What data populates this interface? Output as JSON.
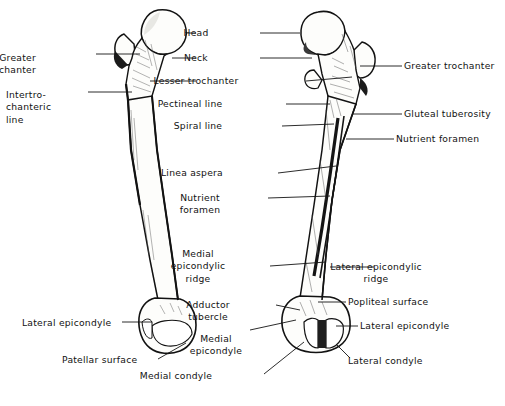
{
  "figure": {
    "background_color": "#ffffff",
    "ink_color": "#121212",
    "bone_fill_color": "#fdfdfb",
    "bone_shade_color": "#5a5a5a",
    "width": 505,
    "height": 406
  },
  "bones": [
    {
      "name": "left-femur-anterior-view",
      "view": "anterior",
      "side": "left"
    },
    {
      "name": "right-femur-posterior-view",
      "view": "posterior",
      "side": "right"
    }
  ],
  "labels": {
    "head": "Head",
    "neck": "Neck",
    "lesser_trochanter": "Lesser trochanter",
    "pectineal_line": "Pectineal line",
    "spiral_line": "Spiral line",
    "linea_aspera": "Linea aspera",
    "nutrient_foramen_center": "Nutrient\nforamen",
    "medial_epicondylic_ridge": "Medial\nepicondylic\nridge",
    "adductor_tubercle": "Adductor\ntubercle",
    "medial_epicondyle": "Medial\nepicondyle",
    "medial_condyle": "Medial condyle",
    "greater_trochanter_left": "Greater\ntrochanter",
    "intertrochanteric_line": "Intertro-\nchanteric\nline",
    "lateral_epicondyle_left": "Lateral epicondyle",
    "patellar_surface": "Patellar surface",
    "greater_trochanter_right": "Greater trochanter",
    "gluteal_tuberosity": "Gluteal tuberosity",
    "nutrient_foramen_right": "Nutrient foramen",
    "lateral_epicondylic_ridge": "Lateral epicondylic\nridge",
    "popliteal_surface": "Popliteal surface",
    "lateral_epicondyle_right": "Lateral epicondyle",
    "lateral_condyle": "Lateral condyle"
  },
  "label_positions": [
    {
      "key": "greater_trochanter_left",
      "x": 36,
      "y": 52,
      "align": "r",
      "w": 86
    },
    {
      "key": "intertrochanteric_line",
      "x": 6,
      "y": 89,
      "align": "l",
      "w": 90
    },
    {
      "key": "lateral_epicondyle_left",
      "x": 22,
      "y": 317,
      "align": "l",
      "w": 100
    },
    {
      "key": "patellar_surface",
      "x": 62,
      "y": 354,
      "align": "l",
      "w": 96
    },
    {
      "key": "head",
      "x": 196,
      "y": 27,
      "align": "c",
      "w": 64
    },
    {
      "key": "neck",
      "x": 196,
      "y": 52,
      "align": "c",
      "w": 64
    },
    {
      "key": "lesser_trochanter",
      "x": 196,
      "y": 75,
      "align": "c",
      "w": 110
    },
    {
      "key": "pectineal_line",
      "x": 190,
      "y": 98,
      "align": "c",
      "w": 96
    },
    {
      "key": "spiral_line",
      "x": 198,
      "y": 120,
      "align": "c",
      "w": 84
    },
    {
      "key": "linea_aspera",
      "x": 192,
      "y": 167,
      "align": "c",
      "w": 86
    },
    {
      "key": "nutrient_foramen_center",
      "x": 200,
      "y": 192,
      "align": "c",
      "w": 68
    },
    {
      "key": "medial_epicondylic_ridge",
      "x": 198,
      "y": 248,
      "align": "c",
      "w": 72
    },
    {
      "key": "adductor_tubercle",
      "x": 208,
      "y": 299,
      "align": "c",
      "w": 68
    },
    {
      "key": "medial_epicondyle",
      "x": 216,
      "y": 333,
      "align": "c",
      "w": 68
    },
    {
      "key": "medial_condyle",
      "x": 176,
      "y": 370,
      "align": "c",
      "w": 88
    },
    {
      "key": "greater_trochanter_right",
      "x": 404,
      "y": 60,
      "align": "l",
      "w": 100
    },
    {
      "key": "gluteal_tuberosity",
      "x": 404,
      "y": 108,
      "align": "l",
      "w": 96
    },
    {
      "key": "nutrient_foramen_right",
      "x": 396,
      "y": 133,
      "align": "l",
      "w": 100
    },
    {
      "key": "lateral_epicondylic_ridge",
      "x": 376,
      "y": 261,
      "align": "c",
      "w": 110
    },
    {
      "key": "popliteal_surface",
      "x": 348,
      "y": 296,
      "align": "l",
      "w": 94
    },
    {
      "key": "lateral_epicondyle_right",
      "x": 360,
      "y": 320,
      "align": "l",
      "w": 96
    },
    {
      "key": "lateral_condyle",
      "x": 348,
      "y": 355,
      "align": "l",
      "w": 88
    }
  ]
}
